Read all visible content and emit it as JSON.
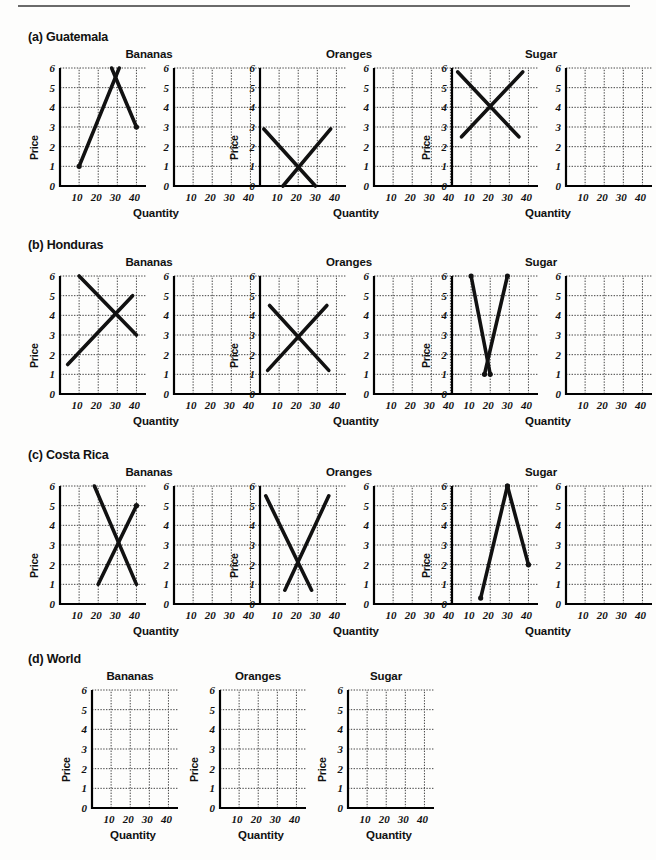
{
  "page": {
    "axis_labels": {
      "x": "Quantity",
      "y": "Price"
    },
    "x_ticks": [
      "10",
      "20",
      "30",
      "40"
    ],
    "y_ticks": [
      "0",
      "1",
      "2",
      "3",
      "4",
      "5",
      "6"
    ],
    "xlim": [
      0,
      45
    ],
    "ylim": [
      0,
      6
    ],
    "line_color": "#111111",
    "grid_color": "#444444",
    "axis_color": "#000000"
  },
  "sections": [
    {
      "id": "guatemala",
      "label": "(a) Guatemala",
      "groups": [
        {
          "id": "guatemala-bananas",
          "title": "Bananas",
          "chart_data": {
            "type": "line",
            "title": "Bananas",
            "xlabel": "Quantity",
            "ylabel": "Price",
            "xlim": [
              0,
              45
            ],
            "ylim": [
              0,
              6
            ],
            "grid": true,
            "series": [
              {
                "name": "supply",
                "x": [
                  10,
                  31
                ],
                "y": [
                  1,
                  6
                ],
                "endpoint_dots": [
                  true,
                  false
                ]
              },
              {
                "name": "demand",
                "x": [
                  27,
                  40
                ],
                "y": [
                  6,
                  3
                ],
                "endpoint_dots": [
                  false,
                  true
                ]
              }
            ]
          }
        },
        {
          "id": "guatemala-oranges",
          "title": "Oranges",
          "chart_data": {
            "type": "line",
            "title": "Oranges",
            "xlabel": "Quantity",
            "ylabel": "Price",
            "xlim": [
              0,
              45
            ],
            "ylim": [
              0,
              6
            ],
            "grid": true,
            "series": [
              {
                "name": "demand",
                "x": [
                  2,
                  29
                ],
                "y": [
                  2.9,
                  0
                ],
                "endpoint_dots": [
                  false,
                  false
                ]
              },
              {
                "name": "supply",
                "x": [
                  12,
                  37
                ],
                "y": [
                  0,
                  2.9
                ],
                "endpoint_dots": [
                  false,
                  false
                ]
              }
            ]
          }
        },
        {
          "id": "guatemala-sugar",
          "title": "Sugar",
          "chart_data": {
            "type": "line",
            "title": "Sugar",
            "xlabel": "Quantity",
            "ylabel": "Price",
            "xlim": [
              0,
              45
            ],
            "ylim": [
              0,
              6
            ],
            "grid": true,
            "series": [
              {
                "name": "demand",
                "x": [
                  3,
                  35
                ],
                "y": [
                  5.8,
                  2.5
                ],
                "endpoint_dots": [
                  false,
                  false
                ]
              },
              {
                "name": "supply",
                "x": [
                  5,
                  37
                ],
                "y": [
                  2.5,
                  5.8
                ],
                "endpoint_dots": [
                  false,
                  false
                ]
              }
            ]
          }
        }
      ]
    },
    {
      "id": "honduras",
      "label": "(b) Honduras",
      "groups": [
        {
          "id": "honduras-bananas",
          "title": "Bananas",
          "chart_data": {
            "type": "line",
            "title": "Bananas",
            "xlabel": "Quantity",
            "ylabel": "Price",
            "xlim": [
              0,
              45
            ],
            "ylim": [
              0,
              6
            ],
            "grid": true,
            "series": [
              {
                "name": "demand",
                "x": [
                  10,
                  40
                ],
                "y": [
                  6,
                  3
                ],
                "endpoint_dots": [
                  false,
                  false
                ]
              },
              {
                "name": "supply",
                "x": [
                  4,
                  38
                ],
                "y": [
                  1.5,
                  5
                ],
                "endpoint_dots": [
                  false,
                  false
                ]
              }
            ]
          }
        },
        {
          "id": "honduras-oranges",
          "title": "Oranges",
          "chart_data": {
            "type": "line",
            "title": "Oranges",
            "xlabel": "Quantity",
            "ylabel": "Price",
            "xlim": [
              0,
              45
            ],
            "ylim": [
              0,
              6
            ],
            "grid": true,
            "series": [
              {
                "name": "demand",
                "x": [
                  5,
                  36
                ],
                "y": [
                  4.5,
                  1.2
                ],
                "endpoint_dots": [
                  false,
                  false
                ]
              },
              {
                "name": "supply",
                "x": [
                  4,
                  35
                ],
                "y": [
                  1.2,
                  4.5
                ],
                "endpoint_dots": [
                  false,
                  false
                ]
              }
            ]
          }
        },
        {
          "id": "honduras-sugar",
          "title": "Sugar",
          "chart_data": {
            "type": "line",
            "title": "Sugar",
            "xlabel": "Quantity",
            "ylabel": "Price",
            "xlim": [
              0,
              45
            ],
            "ylim": [
              0,
              6
            ],
            "grid": true,
            "series": [
              {
                "name": "demand",
                "x": [
                  10,
                  20
                ],
                "y": [
                  6,
                  1
                ],
                "endpoint_dots": [
                  true,
                  true
                ]
              },
              {
                "name": "supply",
                "x": [
                  17,
                  29
                ],
                "y": [
                  1,
                  6
                ],
                "endpoint_dots": [
                  true,
                  true
                ]
              }
            ]
          }
        }
      ]
    },
    {
      "id": "costa-rica",
      "label": "(c) Costa Rica",
      "groups": [
        {
          "id": "costa-rica-bananas",
          "title": "Bananas",
          "chart_data": {
            "type": "line",
            "title": "Bananas",
            "xlabel": "Quantity",
            "ylabel": "Price",
            "xlim": [
              0,
              45
            ],
            "ylim": [
              0,
              6
            ],
            "grid": true,
            "series": [
              {
                "name": "demand",
                "x": [
                  18,
                  40
                ],
                "y": [
                  6,
                  1
                ],
                "endpoint_dots": [
                  false,
                  false
                ]
              },
              {
                "name": "supply",
                "x": [
                  20,
                  40
                ],
                "y": [
                  1,
                  5
                ],
                "endpoint_dots": [
                  false,
                  true
                ]
              }
            ]
          }
        },
        {
          "id": "costa-rica-oranges",
          "title": "Oranges",
          "chart_data": {
            "type": "line",
            "title": "Oranges",
            "xlabel": "Quantity",
            "ylabel": "Price",
            "xlim": [
              0,
              45
            ],
            "ylim": [
              0,
              6
            ],
            "grid": true,
            "series": [
              {
                "name": "demand",
                "x": [
                  3,
                  27
                ],
                "y": [
                  5.5,
                  0.7
                ],
                "endpoint_dots": [
                  false,
                  false
                ]
              },
              {
                "name": "supply",
                "x": [
                  13,
                  36
                ],
                "y": [
                  0.7,
                  5.5
                ],
                "endpoint_dots": [
                  false,
                  false
                ]
              }
            ]
          }
        },
        {
          "id": "costa-rica-sugar",
          "title": "Sugar",
          "chart_data": {
            "type": "line",
            "title": "Sugar",
            "xlabel": "Quantity",
            "ylabel": "Price",
            "xlim": [
              0,
              45
            ],
            "ylim": [
              0,
              6
            ],
            "grid": true,
            "series": [
              {
                "name": "supply",
                "x": [
                  15,
                  29
                ],
                "y": [
                  0.3,
                  6
                ],
                "endpoint_dots": [
                  true,
                  true
                ]
              },
              {
                "name": "demand",
                "x": [
                  29,
                  40
                ],
                "y": [
                  6,
                  2
                ],
                "endpoint_dots": [
                  true,
                  true
                ]
              }
            ]
          }
        }
      ]
    },
    {
      "id": "world",
      "label": "(d) World",
      "groups": [
        {
          "id": "world-bananas",
          "title": "Bananas",
          "chart_data": {
            "type": "line",
            "title": "Bananas",
            "xlabel": "Quantity",
            "ylabel": "Price",
            "xlim": [
              0,
              45
            ],
            "ylim": [
              0,
              6
            ],
            "grid": true,
            "series": []
          }
        },
        {
          "id": "world-oranges",
          "title": "Oranges",
          "chart_data": {
            "type": "line",
            "title": "Oranges",
            "xlabel": "Quantity",
            "ylabel": "Price",
            "xlim": [
              0,
              45
            ],
            "ylim": [
              0,
              6
            ],
            "grid": true,
            "series": []
          }
        },
        {
          "id": "world-sugar",
          "title": "Sugar",
          "chart_data": {
            "type": "line",
            "title": "Sugar",
            "xlabel": "Quantity",
            "ylabel": "Price",
            "xlim": [
              0,
              45
            ],
            "ylim": [
              0,
              6
            ],
            "grid": true,
            "series": []
          }
        }
      ]
    }
  ]
}
